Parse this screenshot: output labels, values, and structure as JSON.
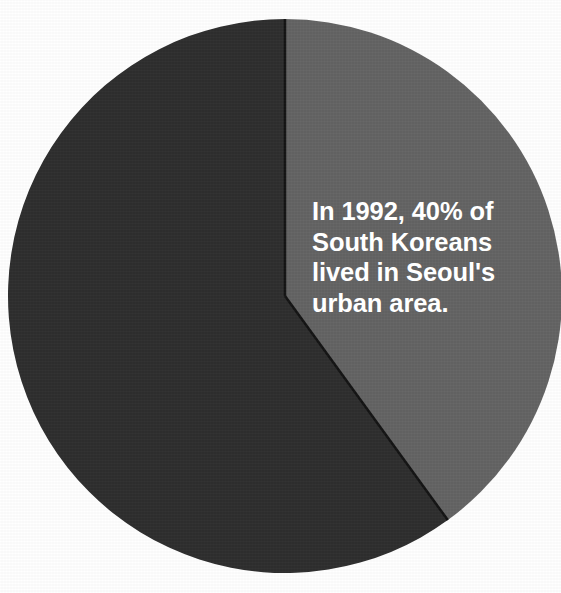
{
  "figure": {
    "background_color": "#ffffff",
    "width": 561,
    "height": 593
  },
  "annotation": {
    "lines": [
      "In 1992, 40% of",
      "South Koreans",
      "lived in Seoul's",
      "urban area."
    ],
    "full_text": "In 1992, 40% of South Koreans lived in Seoul's urban area.",
    "text_color": "#ffffff"
  },
  "chart_data": {
    "type": "pie",
    "title": "",
    "subtitle": "",
    "xlabel": "",
    "ylabel": "",
    "grid": false,
    "legend_position": "none",
    "labels": [
      "Seoul urban area",
      "Rest of South Korea"
    ],
    "values": [
      40,
      60
    ],
    "units": "percent",
    "colors": [
      "#646464",
      "#2e2e2e"
    ],
    "start_angle_deg": 0,
    "direction": "clockwise",
    "annotations": [
      "In 1992, 40% of South Koreans lived in Seoul's urban area."
    ],
    "center": {
      "x": 285,
      "y": 296
    },
    "radius": 277,
    "slices": [
      {
        "label": "Seoul urban area",
        "value": 40,
        "color": "#646464",
        "start_angle_deg": 0,
        "end_angle_deg": 144
      },
      {
        "label": "Rest of South Korea",
        "value": 60,
        "color": "#2e2e2e",
        "start_angle_deg": 144,
        "end_angle_deg": 360
      }
    ]
  }
}
